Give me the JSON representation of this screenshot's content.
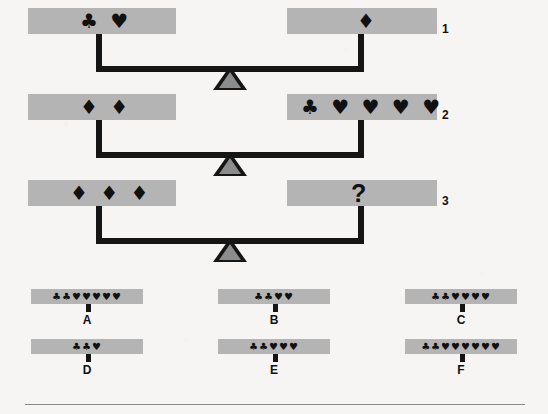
{
  "puzzle": {
    "type": "balance-scale-equivalence",
    "symbols": {
      "club": "♣",
      "heart": "♥",
      "diamond": "♦",
      "unknown": "?"
    },
    "colors": {
      "pan": "#b4b4b4",
      "beam": "#151515",
      "fulcrum_fill": "#8c8c8c",
      "background": "#f6f5f3"
    },
    "rows": [
      {
        "label": "1",
        "left": {
          "symbols": "♣ ♥",
          "counts": {
            "club": 1,
            "heart": 1,
            "diamond": 0
          }
        },
        "right": {
          "symbols": "♦",
          "counts": {
            "club": 0,
            "heart": 0,
            "diamond": 1
          }
        }
      },
      {
        "label": "2",
        "left": {
          "symbols": "♦ ♦",
          "counts": {
            "club": 0,
            "heart": 0,
            "diamond": 2
          }
        },
        "right": {
          "symbols": "♣ ♥ ♥ ♥ ♥",
          "counts": {
            "club": 1,
            "heart": 4,
            "diamond": 0
          }
        }
      },
      {
        "label": "3",
        "left": {
          "symbols": "♦ ♦ ♦",
          "counts": {
            "club": 0,
            "heart": 0,
            "diamond": 3
          }
        },
        "right": {
          "symbols": "?",
          "counts": null,
          "is_unknown": true
        }
      }
    ],
    "options": [
      {
        "letter": "A",
        "symbols": "♣♣♥♥♥♥♥",
        "counts": {
          "club": 2,
          "heart": 5
        }
      },
      {
        "letter": "B",
        "symbols": "♣♣♥♥",
        "counts": {
          "club": 2,
          "heart": 2
        }
      },
      {
        "letter": "C",
        "symbols": "♣♣♥♥♥♥",
        "counts": {
          "club": 2,
          "heart": 4
        }
      },
      {
        "letter": "D",
        "symbols": "♣♣♥",
        "counts": {
          "club": 2,
          "heart": 1
        }
      },
      {
        "letter": "E",
        "symbols": "♣♣♥♥♥",
        "counts": {
          "club": 2,
          "heart": 3
        }
      },
      {
        "letter": "F",
        "symbols": "♣♣♥♥♥♥♥♥",
        "counts": {
          "club": 2,
          "heart": 6
        }
      }
    ]
  }
}
